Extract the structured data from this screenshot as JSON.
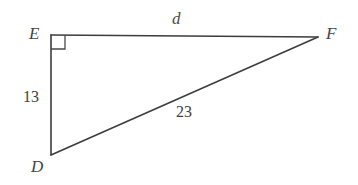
{
  "figure": {
    "type": "right-triangle-diagram",
    "background_color": "#ffffff",
    "stroke_color": "#3d3d3d"
  },
  "vertices": [
    {
      "name": "E",
      "label": "E",
      "x": 51,
      "y": 35
    },
    {
      "name": "F",
      "label": "F",
      "x": 318,
      "y": 37
    },
    {
      "name": "D",
      "label": "D",
      "x": 51,
      "y": 155
    }
  ],
  "sides": [
    {
      "name": "EF",
      "label": "d",
      "from": "E",
      "to": "F",
      "kind": "unknown-length"
    },
    {
      "name": "ED",
      "label": "13",
      "from": "E",
      "to": "D",
      "kind": "leg"
    },
    {
      "name": "DF",
      "label": "23",
      "from": "D",
      "to": "F",
      "kind": "hypotenuse"
    }
  ],
  "angle_markers": [
    {
      "at": "E",
      "type": "right-angle-square",
      "size": 14
    }
  ]
}
